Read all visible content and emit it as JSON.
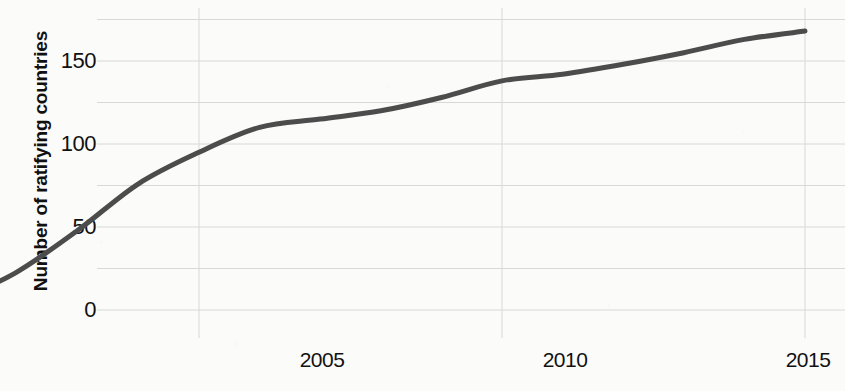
{
  "chart_data": {
    "type": "line",
    "title": "",
    "xlabel": "",
    "ylabel": "Number of ratifying countries",
    "xlim": [
      2000.8,
      2015.0
    ],
    "ylim": [
      -8,
      180
    ],
    "grid": true,
    "legend": false,
    "line_color": "#4c4c4c",
    "line_width": 5,
    "background_color": "#fbfbfa",
    "grid_color": "#d8d8d8",
    "tick_label_color": "#111111",
    "y_ticks_labeled": [
      0,
      50,
      100,
      150
    ],
    "y_gridlines": [
      0,
      25,
      50,
      75,
      100,
      125,
      150,
      175
    ],
    "x_ticks_labeled": [
      2005,
      2010,
      2015
    ],
    "x_gridlines": [
      2000,
      2005,
      2010,
      2015
    ],
    "x": [
      2001,
      2002,
      2003,
      2004,
      2005,
      2006,
      2007,
      2008,
      2009,
      2010,
      2011,
      2012,
      2013,
      2014,
      2015
    ],
    "values": [
      5,
      23,
      48,
      76,
      95,
      110,
      115,
      120,
      128,
      138,
      142,
      148,
      155,
      163,
      168
    ],
    "series": [
      {
        "name": "Number of ratifying countries",
        "values": [
          5,
          23,
          48,
          76,
          95,
          110,
          115,
          120,
          128,
          138,
          142,
          148,
          155,
          163,
          168
        ]
      }
    ]
  },
  "axis": {
    "y_title": "Number of ratifying countries",
    "y_tick_labels": [
      "150",
      "100",
      "50",
      "0"
    ],
    "x_tick_labels": [
      "2005",
      "2010",
      "2015"
    ]
  }
}
